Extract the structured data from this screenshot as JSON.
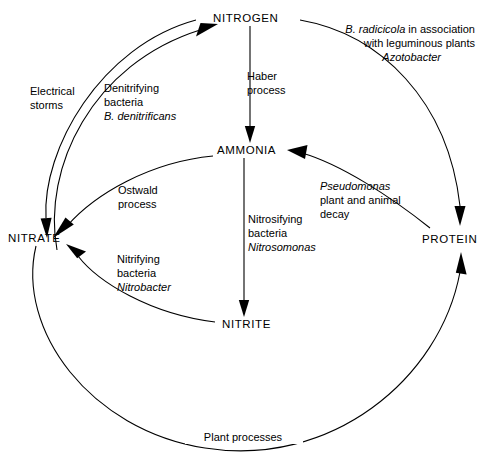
{
  "diagram": {
    "type": "cycle-diagram",
    "line_color": "#000000",
    "background_color": "#ffffff",
    "nodes": [
      {
        "id": "nitrogen",
        "label": "NITROGEN",
        "x": 255,
        "y": 18
      },
      {
        "id": "ammonia",
        "label": "AMMONIA",
        "x": 251,
        "y": 150
      },
      {
        "id": "nitrate",
        "label": "NITRATE",
        "x": 42,
        "y": 238
      },
      {
        "id": "nitrite",
        "label": "NITRITE",
        "x": 249,
        "y": 324
      },
      {
        "id": "protein",
        "label": "PROTEIN",
        "x": 452,
        "y": 239
      }
    ],
    "annotations": {
      "electrical_storms": {
        "lines": [
          "Electrical",
          "storms"
        ],
        "italic_lines": [],
        "x": 30,
        "y": 91
      },
      "denitrifying": {
        "lines": [
          "Denitrifying",
          "bacteria"
        ],
        "italic_lines": [
          "B. denitrificans"
        ],
        "x": 104,
        "y": 89
      },
      "haber": {
        "lines": [
          "Haber",
          "process"
        ],
        "italic_lines": [],
        "x": 247,
        "y": 76
      },
      "rhizobium": {
        "line1_italic": "B. radicicola",
        "line1_rest": " in association",
        "line2": "with leguminous plants",
        "line3_italic": "Azotobacter",
        "x": 475,
        "y": 33
      },
      "ostwald": {
        "lines": [
          "Ostwald",
          "process"
        ],
        "italic_lines": [],
        "x": 118,
        "y": 190
      },
      "pseudomonas": {
        "italic_lines": [
          "Pseudomonas"
        ],
        "lines": [
          "plant and animal",
          "decay"
        ],
        "x": 320,
        "y": 186
      },
      "nitrosifying": {
        "lines": [
          "Nitrosifying",
          "bacteria"
        ],
        "italic_lines": [
          "Nitrosomonas"
        ],
        "x": 248,
        "y": 219
      },
      "nitrifying": {
        "lines": [
          "Nitrifying",
          "bacteria"
        ],
        "italic_lines": [
          "Nitrobacter"
        ],
        "x": 117,
        "y": 259
      },
      "plant_processes": {
        "lines": [
          "Plant processes"
        ],
        "italic_lines": [],
        "x": 243,
        "y": 438
      }
    },
    "flows": [
      {
        "from": "NITRATE",
        "to": "NITROGEN",
        "label": "Denitrifying bacteria B. denitrificans"
      },
      {
        "from": "NITROGEN",
        "to": "NITRATE",
        "label": "Electrical storms"
      },
      {
        "from": "NITROGEN",
        "to": "AMMONIA",
        "label": "Haber process"
      },
      {
        "from": "NITROGEN",
        "to": "PROTEIN",
        "label": "B. radicicola in association with leguminous plants Azotobacter"
      },
      {
        "from": "AMMONIA",
        "to": "NITRATE",
        "label": "Ostwald process"
      },
      {
        "from": "PROTEIN",
        "to": "AMMONIA",
        "label": "Pseudomonas plant and animal decay"
      },
      {
        "from": "AMMONIA",
        "to": "NITRITE",
        "label": "Nitrosifying bacteria Nitrosomonas"
      },
      {
        "from": "NITRITE",
        "to": "NITRATE",
        "label": "Nitrifying bacteria Nitrobacter"
      },
      {
        "from": "NITRATE",
        "to": "PROTEIN",
        "label": "Plant processes"
      }
    ]
  }
}
